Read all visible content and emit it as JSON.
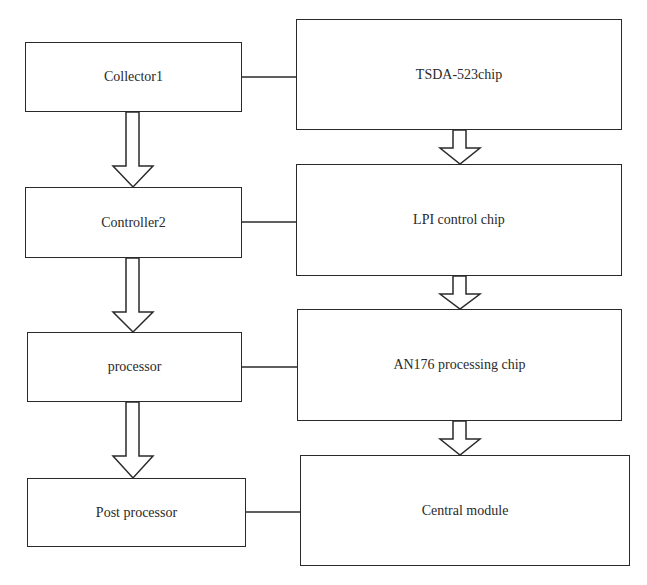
{
  "diagram": {
    "left_column": [
      {
        "id": "collector1",
        "label": "Collector1"
      },
      {
        "id": "controller2",
        "label": "Controller2"
      },
      {
        "id": "processor",
        "label": "processor"
      },
      {
        "id": "post-processor",
        "label": "Post processor"
      }
    ],
    "right_column": [
      {
        "id": "tsda-523chip",
        "label": "TSDA-523chip"
      },
      {
        "id": "lpi-control-chip",
        "label": "LPI control chip"
      },
      {
        "id": "an176-processing-chip",
        "label": "AN176 processing chip"
      },
      {
        "id": "central-module",
        "label": "Central module"
      }
    ],
    "arrows": [
      {
        "from": "collector1",
        "to": "controller2",
        "style": "hollow-block-arrow"
      },
      {
        "from": "controller2",
        "to": "processor",
        "style": "hollow-block-arrow"
      },
      {
        "from": "processor",
        "to": "post-processor",
        "style": "hollow-block-arrow"
      },
      {
        "from": "tsda-523chip",
        "to": "lpi-control-chip",
        "style": "hollow-block-arrow"
      },
      {
        "from": "lpi-control-chip",
        "to": "an176-processing-chip",
        "style": "hollow-block-arrow"
      },
      {
        "from": "an176-processing-chip",
        "to": "central-module",
        "style": "hollow-block-arrow"
      }
    ],
    "links": [
      {
        "from": "collector1",
        "to": "tsda-523chip",
        "style": "line"
      },
      {
        "from": "controller2",
        "to": "lpi-control-chip",
        "style": "line"
      },
      {
        "from": "processor",
        "to": "an176-processing-chip",
        "style": "line"
      },
      {
        "from": "post-processor",
        "to": "central-module",
        "style": "line"
      }
    ],
    "colors": {
      "stroke": "#2a2a2a",
      "background": "#ffffff"
    }
  }
}
